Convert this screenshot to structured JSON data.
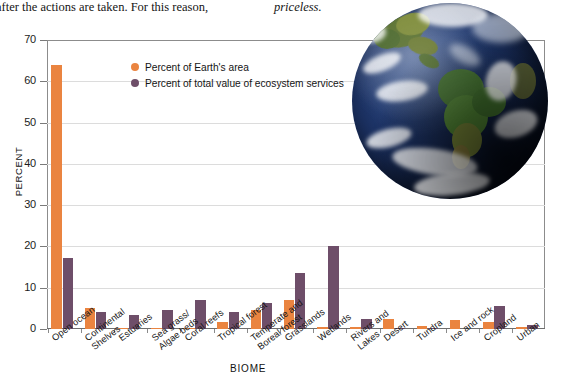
{
  "page_text": {
    "column_a": "after the actions are taken. For this reason,",
    "column_b": "priceless."
  },
  "legend": {
    "series_1": "Percent of Earth's area",
    "series_2": "Percent of total value of ecosystem services"
  },
  "axes": {
    "y_title": "PERCENT",
    "x_title": "BIOME",
    "y_ticks": [
      "0",
      "10",
      "20",
      "30",
      "40",
      "50",
      "60",
      "70"
    ]
  },
  "colors": {
    "series_1": "#ea8440",
    "series_2": "#6e4e69",
    "axis": "#8c8c8c",
    "grid": "#dcdcdc",
    "background": "#ffffff"
  },
  "image": {
    "earth_photo_alt": "earth-photo-blue-marble-americas"
  },
  "chart_data": {
    "type": "bar",
    "title": "",
    "xlabel": "BIOME",
    "ylabel": "PERCENT",
    "ylim": [
      0,
      70
    ],
    "yticks": [
      0,
      10,
      20,
      30,
      40,
      50,
      60,
      70
    ],
    "grid": true,
    "legend_position": "top-left-inside",
    "categories": [
      "Open ocean",
      "Continental Shelves",
      "Estuaries",
      "Sea grass/ Algae beds",
      "Coral reefs",
      "Tropical forest",
      "Temperate and Boreal forest",
      "Grasslands",
      "Wetlands",
      "Rivers and Lakes",
      "Desert",
      "Tundra",
      "Ice and rock",
      "Cropland",
      "Urban"
    ],
    "category_lines": [
      [
        "Open ocean"
      ],
      [
        "Continental",
        "Shelves"
      ],
      [
        "Estuaries"
      ],
      [
        "Sea grass/",
        "Algae beds"
      ],
      [
        "Coral reefs"
      ],
      [
        "Tropical forest"
      ],
      [
        "Temperate and",
        "Boreal forest"
      ],
      [
        "Grasslands"
      ],
      [
        "Wetlands"
      ],
      [
        "Rivers and",
        "Lakes"
      ],
      [
        "Desert"
      ],
      [
        "Tundra"
      ],
      [
        "Ice and rock"
      ],
      [
        "Cropland"
      ],
      [
        "Urban"
      ]
    ],
    "series": [
      {
        "name": "Percent of Earth's area",
        "color": "#ea8440",
        "values": [
          64.0,
          5.0,
          0.3,
          0.3,
          0.1,
          1.7,
          4.7,
          7.0,
          0.4,
          0.6,
          2.5,
          0.8,
          2.3,
          1.7,
          0.5
        ]
      },
      {
        "name": "Percent of total value of ecosystem services",
        "color": "#6e4e69",
        "values": [
          17.2,
          4.2,
          3.3,
          4.7,
          7.0,
          4.2,
          6.3,
          13.6,
          20.0,
          2.5,
          0.2,
          0.1,
          0.0,
          5.5,
          1.0
        ]
      }
    ]
  }
}
